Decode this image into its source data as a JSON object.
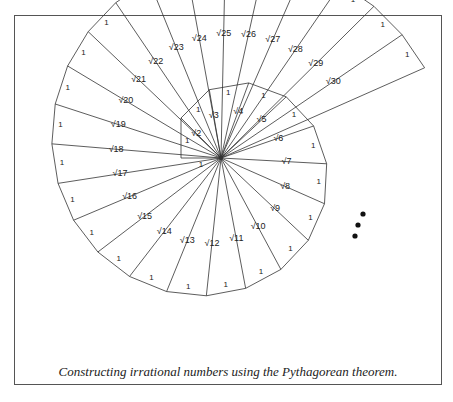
{
  "figure": {
    "caption": "Constructing irrational numbers using the Pythagorean theorem.",
    "colors": {
      "line": "#333333",
      "text": "#222222",
      "frame": "#555555",
      "background": "#ffffff"
    }
  },
  "spiral": {
    "center": [
      221,
      158
    ],
    "unit_px": 40,
    "start_angle_deg": 180,
    "triangle_count": 30,
    "leg_label": "1",
    "hypotenuse_labels": [
      "√2",
      "√3",
      "√4",
      "√5",
      "√6",
      "√7",
      "√8",
      "√9",
      "√10",
      "√11",
      "√12",
      "√13",
      "√14",
      "√15",
      "√16",
      "√17",
      "√18",
      "√19",
      "√20",
      "√21",
      "√22",
      "√23",
      "√24",
      "√25",
      "√26",
      "√27",
      "√28",
      "√29",
      "√30"
    ],
    "continuation": {
      "symbol": "dots",
      "count": 3,
      "points": [
        [
          363,
          214
        ],
        [
          358,
          225
        ],
        [
          355,
          236
        ]
      ]
    }
  }
}
